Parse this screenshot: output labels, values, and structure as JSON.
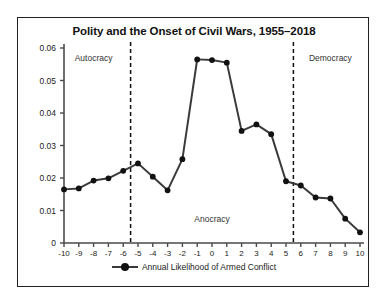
{
  "chart": {
    "title": "Polity and the Onset of Civil Wars, 1955–2018",
    "legend_label": "Annual Likelihood of Armed Conflict",
    "region_labels": {
      "left": "Autocracy",
      "middle": "Anocracy",
      "right": "Democracy"
    },
    "series_color": "#3a3a3a",
    "marker_color": "#111111",
    "divider_color": "#111111"
  },
  "chart_data": {
    "type": "line",
    "title": "Polity and the Onset of Civil Wars, 1955–2018",
    "xlabel": "",
    "ylabel": "",
    "xlim": [
      -10,
      10
    ],
    "ylim": [
      0,
      0.06
    ],
    "grid": false,
    "legend_position": "bottom",
    "x": [
      -10,
      -9,
      -8,
      -7,
      -6,
      -5,
      -4,
      -3,
      -2,
      -1,
      0,
      1,
      2,
      3,
      4,
      5,
      6,
      7,
      8,
      9,
      10
    ],
    "xtick_labels": [
      "-10",
      "-9",
      "-8",
      "-7",
      "-6",
      "-5",
      "-4",
      "-3",
      "-2",
      "-1",
      "0",
      "1",
      "2",
      "3",
      "4",
      "5",
      "6",
      "7",
      "8",
      "9",
      "10"
    ],
    "ytick_values": [
      0,
      0.01,
      0.02,
      0.03,
      0.04,
      0.05,
      0.06
    ],
    "ytick_labels": [
      "0",
      "0.01",
      "0.02",
      "0.03",
      "0.04",
      "0.05",
      "0.06"
    ],
    "series": [
      {
        "name": "Annual Likelihood of Armed Conflict",
        "values": [
          0.0165,
          0.0168,
          0.0192,
          0.0199,
          0.0222,
          0.0245,
          0.0204,
          0.0162,
          0.0258,
          0.0565,
          0.0563,
          0.0555,
          0.0345,
          0.0365,
          0.0335,
          0.019,
          0.0177,
          0.014,
          0.0137,
          0.0075,
          0.0033
        ]
      }
    ],
    "annotations": [
      {
        "text": "Autocracy",
        "x": -8.0,
        "y": 0.0565
      },
      {
        "text": "Anocracy",
        "x": 0.0,
        "y": 0.0072
      },
      {
        "text": "Democracy",
        "x": 8.0,
        "y": 0.0565
      }
    ],
    "vlines": [
      -5.5,
      5.5
    ]
  }
}
